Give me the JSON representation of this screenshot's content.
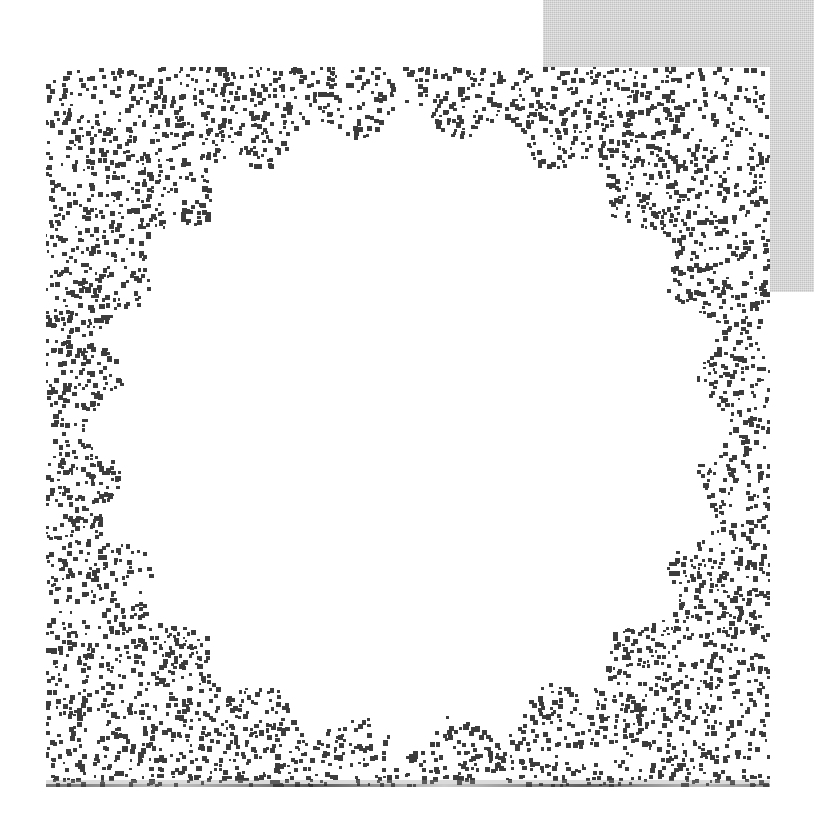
{
  "page": {
    "width": 814,
    "height": 835,
    "background_color": "#ffffff",
    "kind": "scanned-figure-page"
  },
  "gray_block": {
    "name": "gray-panel",
    "x": 543,
    "y": 0,
    "width": 271,
    "height": 292,
    "color": "#cbcbcb"
  },
  "micrograph": {
    "name": "electron-micrograph",
    "x": 46,
    "y": 67,
    "width": 724,
    "height": 720,
    "background_color": "#ffffff",
    "ink_color": "#3c3c3c",
    "description": "halftone electron micrograph of a circular icosahedral particle",
    "particle": {
      "center_x": 362,
      "center_y": 358,
      "radius": 296,
      "lobes": 20,
      "lobe_depth": 16,
      "core_radius": 232,
      "ring_count": 9,
      "spiral_arms": 24,
      "fill_color": "#4a4a4a"
    },
    "noise": {
      "background_density": 0.3,
      "particle_density": 0.86,
      "dot_size": 4,
      "seed": 20250411
    },
    "scan_edge": {
      "name": "bottom-scan-line",
      "visible": true
    }
  },
  "chart_data": {
    "type": "heatmap",
    "title": "",
    "xlabel": "",
    "ylabel": "",
    "intensity_profile": {
      "radius_fraction": [
        0.0,
        0.1,
        0.2,
        0.3,
        0.4,
        0.5,
        0.6,
        0.7,
        0.8,
        0.9,
        1.0,
        1.15,
        1.3
      ],
      "darkness": [
        0.72,
        0.74,
        0.76,
        0.78,
        0.8,
        0.82,
        0.85,
        0.88,
        0.9,
        0.86,
        0.7,
        0.36,
        0.28
      ]
    }
  }
}
